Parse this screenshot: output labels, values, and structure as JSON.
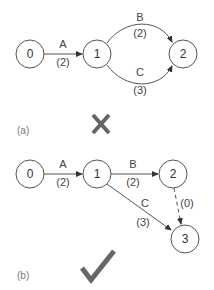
{
  "diagram_a": {
    "caption": "(a)",
    "verdict": "cross-mark",
    "verdict_color": "#666666",
    "nodes": [
      {
        "id": "0",
        "label": "0"
      },
      {
        "id": "1",
        "label": "1"
      },
      {
        "id": "2",
        "label": "2"
      }
    ],
    "edges": [
      {
        "from": "0",
        "to": "1",
        "name": "A",
        "duration": "(2)"
      },
      {
        "from": "1",
        "to": "2",
        "name": "B",
        "duration": "(2)"
      },
      {
        "from": "1",
        "to": "2",
        "name": "C",
        "duration": "(3)"
      }
    ]
  },
  "diagram_b": {
    "caption": "(b)",
    "verdict": "check-mark",
    "verdict_color": "#666666",
    "nodes": [
      {
        "id": "0",
        "label": "0"
      },
      {
        "id": "1",
        "label": "1"
      },
      {
        "id": "2",
        "label": "2"
      },
      {
        "id": "3",
        "label": "3"
      }
    ],
    "edges": [
      {
        "from": "0",
        "to": "1",
        "name": "A",
        "duration": "(2)"
      },
      {
        "from": "1",
        "to": "2",
        "name": "B",
        "duration": "(2)"
      },
      {
        "from": "1",
        "to": "3",
        "name": "C",
        "duration": "(3)"
      },
      {
        "from": "2",
        "to": "3",
        "name": "",
        "duration": "(0)",
        "dummy": true
      }
    ]
  }
}
